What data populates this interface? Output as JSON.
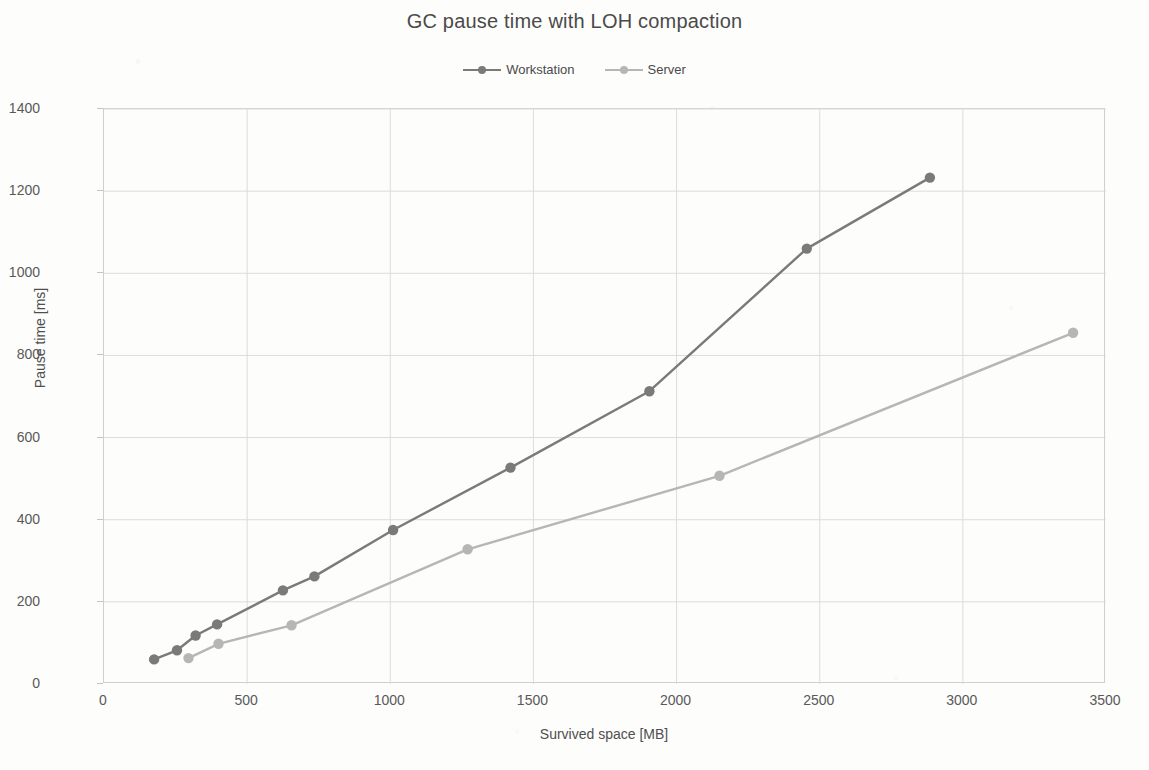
{
  "chart_data": {
    "type": "line",
    "title": "GC pause time with LOH compaction",
    "xlabel": "Survived space [MB]",
    "ylabel": "Pause time [ms]",
    "xlim": [
      0,
      3500
    ],
    "ylim": [
      0,
      1400
    ],
    "xticks": [
      0,
      500,
      1000,
      1500,
      2000,
      2500,
      3000,
      3500
    ],
    "yticks": [
      0,
      200,
      400,
      600,
      800,
      1000,
      1200,
      1400
    ],
    "grid": true,
    "legend_position": "top-center",
    "markers": "circle",
    "series": [
      {
        "name": "Workstation",
        "color": "#7a7a7a",
        "points": [
          {
            "x": 175,
            "y": 60
          },
          {
            "x": 255,
            "y": 82
          },
          {
            "x": 320,
            "y": 118
          },
          {
            "x": 395,
            "y": 145
          },
          {
            "x": 625,
            "y": 228
          },
          {
            "x": 735,
            "y": 262
          },
          {
            "x": 1010,
            "y": 375
          },
          {
            "x": 1420,
            "y": 527
          },
          {
            "x": 1905,
            "y": 713
          },
          {
            "x": 2455,
            "y": 1060
          },
          {
            "x": 2885,
            "y": 1233
          }
        ]
      },
      {
        "name": "Server",
        "color": "#b6b6b6",
        "points": [
          {
            "x": 295,
            "y": 63
          },
          {
            "x": 400,
            "y": 98
          },
          {
            "x": 655,
            "y": 143
          },
          {
            "x": 1270,
            "y": 328
          },
          {
            "x": 2150,
            "y": 507
          },
          {
            "x": 3385,
            "y": 855
          }
        ]
      }
    ]
  },
  "legend": {
    "entries": [
      {
        "label": "Workstation"
      },
      {
        "label": "Server"
      }
    ]
  }
}
